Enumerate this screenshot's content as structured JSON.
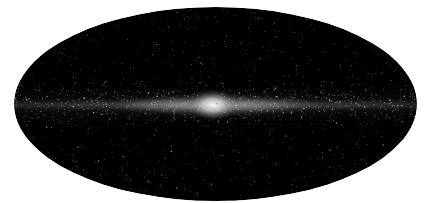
{
  "image": {
    "subject": "all-sky map of the Milky Way galaxy",
    "projection": "Mollweide (elliptical all-sky)",
    "description": "Black elliptical sky map with a bright horizontal galactic disk band and a central bulge glow, scattered point-like stars",
    "colors": {
      "background": "#ffffff",
      "sky": "#000000",
      "band": "#bdbdbd",
      "bulge": "#f2f2f2",
      "stars": "#d9d9d9"
    },
    "ellipse": {
      "cx": 215.5,
      "cy": 104,
      "rx": 201.5,
      "ry": 97
    },
    "bulge_center": {
      "x": 213,
      "y": 105
    }
  }
}
